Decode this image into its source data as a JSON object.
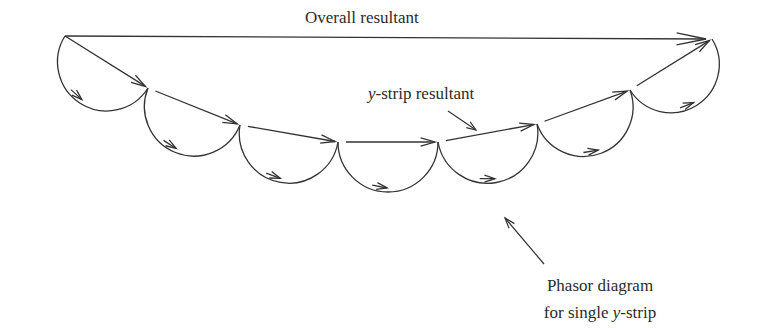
{
  "diagram": {
    "labels": {
      "overall_resultant": "Overall resultant",
      "strip_resultant_prefix": "y",
      "strip_resultant_suffix": "-strip resultant",
      "phasor_line1": "Phasor diagram",
      "phasor_line2_prefix": "for single ",
      "phasor_line2_var": "y",
      "phasor_line2_suffix": "-strip"
    },
    "colors": {
      "stroke": "#333333",
      "text": "#2b2b2b",
      "background": "#ffffff"
    },
    "nodes": [
      {
        "x": 65,
        "y": 36
      },
      {
        "x": 148,
        "y": 88
      },
      {
        "x": 240,
        "y": 125
      },
      {
        "x": 338,
        "y": 142
      },
      {
        "x": 438,
        "y": 142
      },
      {
        "x": 537,
        "y": 124
      },
      {
        "x": 630,
        "y": 90
      },
      {
        "x": 712,
        "y": 39
      }
    ],
    "overall_resultant": {
      "from": {
        "x": 65,
        "y": 36
      },
      "to": {
        "x": 712,
        "y": 39
      }
    },
    "strip_count": 7
  }
}
